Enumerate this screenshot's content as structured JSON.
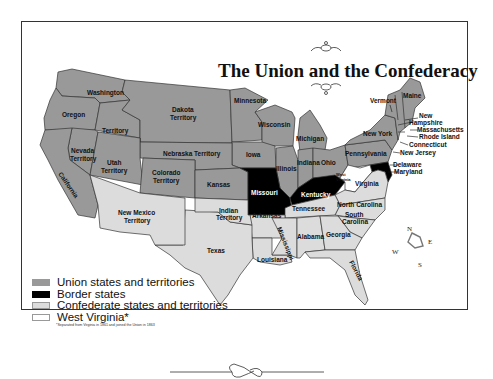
{
  "title": "The Union and the Confederacy",
  "colors": {
    "union": "#999999",
    "border": "#000000",
    "confederate": "#dcdcdc",
    "west_virginia": "#ffffff",
    "outline": "#333333"
  },
  "legend": [
    {
      "key": "union",
      "label": "Union states and territories",
      "color": "#999999"
    },
    {
      "key": "border",
      "label": "Border states",
      "color": "#000000"
    },
    {
      "key": "confederate",
      "label": "Confederate states and territories",
      "color": "#dcdcdc"
    },
    {
      "key": "west_virginia",
      "label": "West Virginia*",
      "color": "#ffffff"
    }
  ],
  "footnote": "*Separated from Virginia in 1861 and joined the Union in 1863",
  "compass": {
    "n": "N",
    "e": "E",
    "s": "S",
    "w": "W"
  },
  "labels": {
    "washington": "Washington",
    "oregon": "Oregon",
    "territory": "Territory",
    "dakota": "Dakota",
    "dakota_territory": "Territory",
    "minnesota": "Minnesota",
    "wisconsin": "Wisconsin",
    "michigan": "Michigan",
    "iowa": "Iowa",
    "illinois": "Illinois",
    "indiana": "Indiana",
    "ohio": "Ohio",
    "nebraska": "Nebraska Territory",
    "nevada": "Nevada",
    "nevada_t": "Territory",
    "utah": "Utah",
    "utah_t": "Territory",
    "colorado": "Colorado",
    "colorado_t": "Territory",
    "kansas": "Kansas",
    "california": "California",
    "new_mexico": "New Mexico",
    "new_mexico_t": "Territory",
    "indian": "Indian",
    "indian_t": "Territory",
    "texas": "Texas",
    "missouri": "Missouri",
    "kentucky": "Kentucky",
    "arkansas": "Arkansas",
    "tennessee": "Tennessee",
    "louisiana": "Louisiana",
    "mississippi": "Mississippi",
    "alabama": "Alabama",
    "georgia": "Georgia",
    "florida": "Florida",
    "north_carolina": "North Carolina",
    "south": "South",
    "carolina": "Carolina",
    "virginia": "Virginia",
    "west": "West",
    "wvirginia": "Virginia",
    "pennsylvania": "Pennsylvania",
    "new_york": "New York",
    "vermont": "Vermont",
    "maine": "Maine",
    "new": "New",
    "hampshire": "Hampshire",
    "massachusetts": "Massachusetts",
    "rhode_island": "Rhode Island",
    "connecticut": "Connecticut",
    "new_jersey": "New Jersey",
    "delaware": "Delaware",
    "maryland": "Maryland"
  }
}
